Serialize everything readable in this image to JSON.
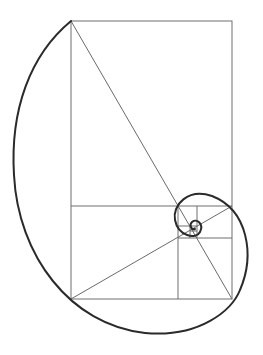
{
  "diagram": {
    "title": "",
    "type": "golden-spiral",
    "colors": {
      "background": "#ffffff",
      "grid": "#6e6e6e",
      "diagonal": "#6a6a6a",
      "spiral": "#2a2a2a"
    },
    "outer_rectangle": {
      "x": 71,
      "y": 21,
      "width": 161,
      "height": 278
    },
    "divisions": [
      {
        "name": "horizontal-main",
        "x1": 71,
        "y1": 206,
        "x2": 232,
        "y2": 206
      },
      {
        "name": "vertical-main",
        "x1": 178,
        "y1": 206,
        "x2": 178,
        "y2": 299
      },
      {
        "name": "horizontal-2",
        "x1": 178,
        "y1": 238,
        "x2": 232,
        "y2": 238
      },
      {
        "name": "vertical-2",
        "x1": 197,
        "y1": 206,
        "x2": 197,
        "y2": 238
      },
      {
        "name": "horizontal-3",
        "x1": 178,
        "y1": 226,
        "x2": 197,
        "y2": 226
      },
      {
        "name": "vertical-3",
        "x1": 190,
        "y1": 226,
        "x2": 190,
        "y2": 238
      },
      {
        "name": "horizontal-4",
        "x1": 190,
        "y1": 231,
        "x2": 197,
        "y2": 231
      }
    ],
    "diagonals": [
      {
        "name": "diagonal-main",
        "x1": 71,
        "y1": 21,
        "x2": 232,
        "y2": 299
      },
      {
        "name": "diagonal-cross",
        "x1": 71,
        "y1": 299,
        "x2": 232,
        "y2": 206
      }
    ],
    "spiral_path": "M 71 21 C 30 55, 10 110, 14 175 C 18 255, 70 325, 145 333 C 200 338, 232 310, 240 290 C 255 255, 248 210, 212 196 C 188 188, 172 205, 175 220 C 178 236, 196 240, 200 232 C 204 224, 197 218, 192 222 C 189 225, 191 230, 195 229"
  }
}
